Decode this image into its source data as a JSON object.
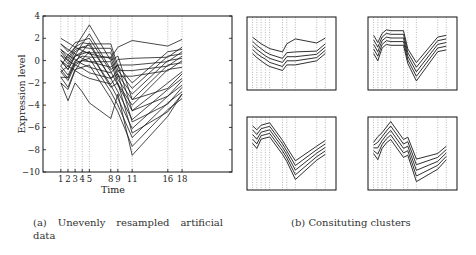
{
  "chart_data": [
    {
      "type": "line",
      "title": "",
      "xlabel": "Time",
      "ylabel": "Expression level",
      "x": [
        1,
        2,
        3,
        4,
        5,
        8,
        9,
        11,
        16,
        18
      ],
      "xticks": [
        "1",
        "2",
        "3",
        "4",
        "5",
        "8",
        "9",
        "11",
        "16",
        "18"
      ],
      "yticks": [
        "4",
        "2",
        "0",
        "-2",
        "-4",
        "-6",
        "-8",
        "-10"
      ],
      "ylim": [
        -10,
        4
      ],
      "xlim": [
        -1.5,
        25
      ],
      "grid": "vertical dotted at sample times",
      "legend": null,
      "series": [
        {
          "name": "c1-1",
          "values": [
            2.0,
            1.6,
            1.2,
            0.9,
            0.6,
            0.2,
            1.2,
            1.8,
            1.3,
            1.9
          ]
        },
        {
          "name": "c1-2",
          "values": [
            1.5,
            1.0,
            0.6,
            0.2,
            -0.1,
            -0.6,
            0.1,
            0.2,
            0.3,
            1.2
          ]
        },
        {
          "name": "c1-3",
          "values": [
            1.0,
            0.5,
            0.1,
            -0.3,
            -0.6,
            -1.1,
            -0.4,
            -0.4,
            -0.1,
            0.8
          ]
        },
        {
          "name": "c1-4",
          "values": [
            0.5,
            0.0,
            -0.4,
            -0.7,
            -1.1,
            -1.6,
            -0.9,
            -0.9,
            -0.5,
            0.4
          ]
        },
        {
          "name": "c1-5",
          "values": [
            0.0,
            -0.5,
            -0.9,
            -1.3,
            -1.6,
            -2.1,
            -1.4,
            -1.4,
            -0.9,
            0.0
          ]
        },
        {
          "name": "c2-1",
          "values": [
            1.0,
            0.2,
            1.2,
            1.6,
            1.5,
            1.5,
            -0.5,
            -2.0,
            0.8,
            1.0
          ]
        },
        {
          "name": "c2-2",
          "values": [
            0.5,
            -0.3,
            0.8,
            1.2,
            1.1,
            1.1,
            -0.9,
            -2.5,
            0.4,
            0.6
          ]
        },
        {
          "name": "c2-3",
          "values": [
            0.0,
            -0.8,
            0.4,
            0.8,
            0.7,
            0.7,
            -1.3,
            -3.0,
            0.0,
            0.2
          ]
        },
        {
          "name": "c2-4",
          "values": [
            -0.5,
            -1.3,
            0.0,
            0.4,
            0.3,
            0.3,
            -1.7,
            -3.5,
            -0.4,
            -0.2
          ]
        },
        {
          "name": "c2-5",
          "values": [
            -1.0,
            -1.8,
            -0.4,
            0.0,
            -0.1,
            -0.1,
            -2.1,
            -4.0,
            -0.8,
            -0.6
          ]
        },
        {
          "name": "c3-1",
          "values": [
            1.5,
            0.8,
            1.6,
            1.8,
            2.0,
            -1.0,
            -2.2,
            -4.5,
            -2.0,
            -1.0
          ]
        },
        {
          "name": "c3-2",
          "values": [
            0.8,
            0.0,
            1.0,
            1.2,
            1.4,
            -1.6,
            -2.8,
            -5.3,
            -2.6,
            -1.6
          ]
        },
        {
          "name": "c3-3",
          "values": [
            0.0,
            -0.8,
            0.4,
            0.6,
            0.8,
            -2.2,
            -3.4,
            -6.1,
            -3.2,
            -2.2
          ]
        },
        {
          "name": "c3-4",
          "values": [
            -0.8,
            -1.6,
            -0.2,
            0.0,
            0.2,
            -2.8,
            -4.0,
            -6.9,
            -3.8,
            -2.8
          ]
        },
        {
          "name": "c3-5",
          "values": [
            -1.5,
            -2.4,
            -0.8,
            -0.6,
            -0.4,
            -3.4,
            -4.6,
            -7.7,
            -4.4,
            -3.4
          ]
        },
        {
          "name": "c4-1",
          "values": [
            -0.5,
            0.5,
            1.2,
            2.2,
            3.2,
            0.0,
            0.4,
            -3.5,
            -2.5,
            -1.2
          ]
        },
        {
          "name": "c4-2",
          "values": [
            -1.0,
            -0.5,
            0.5,
            1.5,
            2.4,
            -0.8,
            -0.4,
            -4.5,
            -3.2,
            -1.8
          ]
        },
        {
          "name": "c4-3",
          "values": [
            -1.5,
            -1.5,
            -0.2,
            0.8,
            1.6,
            -1.6,
            -1.2,
            -5.5,
            -3.9,
            -2.4
          ]
        },
        {
          "name": "c4-4",
          "values": [
            -2.0,
            -2.6,
            -0.9,
            0.1,
            0.8,
            -2.4,
            -2.0,
            -6.5,
            -4.6,
            -3.0
          ]
        },
        {
          "name": "c4-5",
          "values": [
            -2.0,
            -3.6,
            -2.0,
            -2.8,
            -3.8,
            -5.2,
            -3.0,
            -8.5,
            -5.0,
            -3.0
          ]
        }
      ]
    },
    {
      "type": "line",
      "title": "Cluster 1",
      "x": [
        1,
        2,
        3,
        4,
        5,
        8,
        9,
        11,
        16,
        18
      ],
      "series": [
        {
          "name": "s1",
          "values": [
            2.0,
            1.6,
            1.2,
            0.9,
            0.6,
            0.2,
            1.2,
            1.8,
            1.3,
            1.9
          ]
        },
        {
          "name": "s2",
          "values": [
            1.5,
            1.0,
            0.6,
            0.2,
            -0.1,
            -0.6,
            0.1,
            0.2,
            0.3,
            1.2
          ]
        },
        {
          "name": "s3",
          "values": [
            1.0,
            0.5,
            0.1,
            -0.3,
            -0.6,
            -1.1,
            -0.4,
            -0.4,
            -0.1,
            0.8
          ]
        },
        {
          "name": "s4",
          "values": [
            0.5,
            0.0,
            -0.4,
            -0.7,
            -1.1,
            -1.6,
            -0.9,
            -0.9,
            -0.5,
            0.4
          ]
        },
        {
          "name": "s5",
          "values": [
            0.0,
            -0.5,
            -0.9,
            -1.3,
            -1.6,
            -2.1,
            -1.4,
            -1.4,
            -0.9,
            0.0
          ]
        }
      ]
    },
    {
      "type": "line",
      "title": "Cluster 2",
      "x": [
        1,
        2,
        3,
        4,
        5,
        8,
        9,
        11,
        16,
        18
      ],
      "series": [
        {
          "name": "s1",
          "values": [
            1.0,
            0.2,
            1.2,
            1.6,
            1.5,
            1.5,
            -0.5,
            -2.0,
            0.8,
            1.0
          ]
        },
        {
          "name": "s2",
          "values": [
            0.5,
            -0.3,
            0.8,
            1.2,
            1.1,
            1.1,
            -0.9,
            -2.5,
            0.4,
            0.6
          ]
        },
        {
          "name": "s3",
          "values": [
            0.0,
            -0.8,
            0.4,
            0.8,
            0.7,
            0.7,
            -1.3,
            -3.0,
            0.0,
            0.2
          ]
        },
        {
          "name": "s4",
          "values": [
            -0.5,
            -1.3,
            0.0,
            0.4,
            0.3,
            0.3,
            -1.7,
            -3.5,
            -0.4,
            -0.2
          ]
        },
        {
          "name": "s5",
          "values": [
            -1.0,
            -1.8,
            -0.4,
            0.0,
            -0.1,
            -0.1,
            -2.1,
            -4.0,
            -0.8,
            -0.6
          ]
        }
      ]
    },
    {
      "type": "line",
      "title": "Cluster 3",
      "x": [
        1,
        2,
        3,
        4,
        5,
        8,
        9,
        11,
        16,
        18
      ],
      "series": [
        {
          "name": "s1",
          "values": [
            1.5,
            0.8,
            1.6,
            1.8,
            2.0,
            -1.0,
            -2.2,
            -4.5,
            -2.0,
            -1.0
          ]
        },
        {
          "name": "s2",
          "values": [
            0.8,
            0.0,
            1.0,
            1.2,
            1.4,
            -1.6,
            -2.8,
            -5.3,
            -2.6,
            -1.6
          ]
        },
        {
          "name": "s3",
          "values": [
            0.0,
            -0.8,
            0.4,
            0.6,
            0.8,
            -2.2,
            -3.4,
            -6.1,
            -3.2,
            -2.2
          ]
        },
        {
          "name": "s4",
          "values": [
            -0.8,
            -1.6,
            -0.2,
            0.0,
            0.2,
            -2.8,
            -4.0,
            -6.9,
            -3.8,
            -2.8
          ]
        },
        {
          "name": "s5",
          "values": [
            -1.5,
            -2.4,
            -0.8,
            -0.6,
            -0.4,
            -3.4,
            -4.6,
            -7.7,
            -4.4,
            -3.4
          ]
        }
      ]
    },
    {
      "type": "line",
      "title": "Cluster 4",
      "x": [
        1,
        2,
        3,
        4,
        5,
        8,
        9,
        11,
        16,
        18
      ],
      "series": [
        {
          "name": "s1",
          "values": [
            -0.5,
            0.5,
            1.2,
            2.2,
            3.2,
            0.0,
            0.4,
            -3.5,
            -2.5,
            -1.2
          ]
        },
        {
          "name": "s2",
          "values": [
            -1.0,
            -0.5,
            0.5,
            1.5,
            2.4,
            -0.8,
            -0.4,
            -4.5,
            -3.2,
            -1.8
          ]
        },
        {
          "name": "s3",
          "values": [
            -1.5,
            -1.5,
            -0.2,
            0.8,
            1.6,
            -1.6,
            -1.2,
            -5.5,
            -3.9,
            -2.4
          ]
        },
        {
          "name": "s4",
          "values": [
            -2.0,
            -2.6,
            -0.9,
            0.1,
            0.8,
            -2.4,
            -2.0,
            -6.5,
            -4.6,
            -3.0
          ]
        },
        {
          "name": "s5",
          "values": [
            -2.5,
            -3.6,
            -1.6,
            -0.6,
            0.0,
            -3.2,
            -2.8,
            -7.5,
            -5.3,
            -3.6
          ]
        }
      ]
    }
  ],
  "captions": {
    "a": "(a)  Unevenly  resampled  artificial data",
    "b": "(b) Consituting clusters"
  },
  "colors": {
    "line": "#1a1a1a",
    "grid": "#888888",
    "axis": "#111111"
  }
}
